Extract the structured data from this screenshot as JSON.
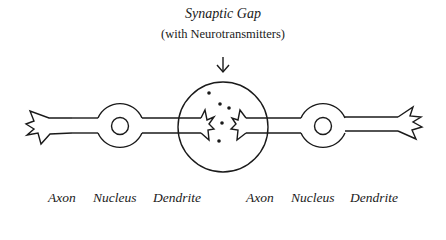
{
  "diagram": {
    "title": "Synaptic Gap",
    "subtitle": "(with Neurotransmitters)",
    "stroke_color": "#1a1a1a",
    "background_color": "#ffffff",
    "neurons": [
      {
        "labels": [
          "Axon",
          "Nucleus",
          "Dendrite"
        ]
      },
      {
        "labels": [
          "Axon",
          "Nucleus",
          "Dendrite"
        ]
      }
    ],
    "synapse": {
      "label": "Synaptic Gap",
      "neurotransmitter_count": 5
    }
  }
}
